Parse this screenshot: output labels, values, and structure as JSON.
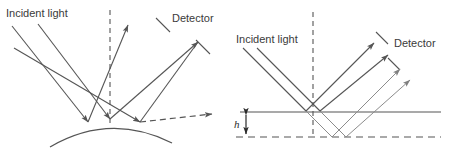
{
  "figure": {
    "background_color": "#ffffff",
    "stroke_color": "#555555",
    "stroke_color_light": "#8c8c8c",
    "text_color": "#3a3a3a",
    "panels": [
      {
        "id": "left",
        "name": "rough-curved-surface-scattering",
        "labels": {
          "incident_light": "Incident light",
          "detector": "Detector"
        },
        "elements": {
          "surface_type": "convex-curved-arc",
          "normal_line": "dashed-vertical",
          "incident_rays": 3,
          "reflected_rays": 3,
          "scattered_ray": "dashed-arrow-right"
        }
      },
      {
        "id": "right",
        "name": "flat-surface-step-height",
        "labels": {
          "incident_light": "Incident light",
          "detector": "Detector",
          "height": "h"
        },
        "elements": {
          "surface_type": "flat-horizontal-line",
          "offset_surface": "dashed-horizontal-line",
          "normal_line": "dashed-vertical",
          "incident_rays": 2,
          "reflected_rays": 4,
          "height_arrow": "double-headed-vertical"
        }
      }
    ]
  }
}
